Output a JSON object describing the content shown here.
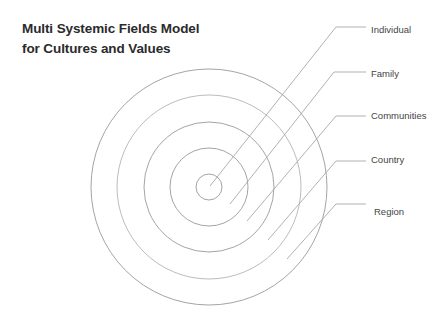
{
  "title": {
    "line1": "Multi Systemic Fields Model",
    "line2": "for Cultures and Values"
  },
  "colors": {
    "circle_stroke": "#9a9a9a",
    "leader_stroke": "#a8a8a8",
    "label_text": "#444444",
    "title_text": "#2b2b2b"
  },
  "diagram": {
    "center": [
      209,
      187
    ],
    "rings": [
      {
        "name": "Individual",
        "radius": 13
      },
      {
        "name": "Family",
        "radius": 39
      },
      {
        "name": "Communities",
        "radius": 65
      },
      {
        "name": "Country",
        "radius": 92
      },
      {
        "name": "Region",
        "radius": 118
      }
    ]
  },
  "labels": {
    "individual": "Individual",
    "family": "Family",
    "communities": "Communities",
    "country": "Country",
    "region": "Region"
  }
}
